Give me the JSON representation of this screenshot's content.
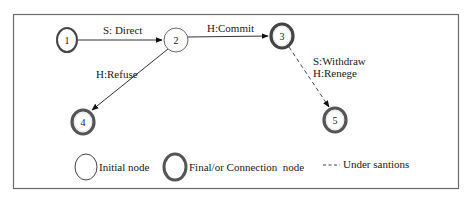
{
  "diagram": {
    "title": "",
    "nodes": [
      {
        "id": "1",
        "label": "1",
        "type": "initial-bold",
        "cx": 67,
        "cy": 40
      },
      {
        "id": "2",
        "label": "2",
        "type": "initial",
        "cx": 176,
        "cy": 40
      },
      {
        "id": "3",
        "label": "3",
        "type": "final",
        "cx": 282,
        "cy": 36
      },
      {
        "id": "4",
        "label": "4",
        "type": "final",
        "cx": 83,
        "cy": 122
      },
      {
        "id": "5",
        "label": "5",
        "type": "final",
        "cx": 335,
        "cy": 120
      }
    ],
    "edges": [
      {
        "from": "1",
        "to": "2",
        "label": "S: Direct",
        "style": "solid"
      },
      {
        "from": "2",
        "to": "3",
        "label": "H:Commit",
        "style": "solid"
      },
      {
        "from": "2",
        "to": "4",
        "label": "H:Refuse",
        "style": "solid"
      },
      {
        "from": "3",
        "to": "5",
        "label_line1": "S:Withdraw",
        "label_line2": "H:Renege",
        "style": "dashed"
      }
    ],
    "legend": {
      "initial": "Initial node",
      "final": "Final/or Connection  node",
      "dashed_line": "- - - -",
      "dashed": "Under santions"
    }
  }
}
